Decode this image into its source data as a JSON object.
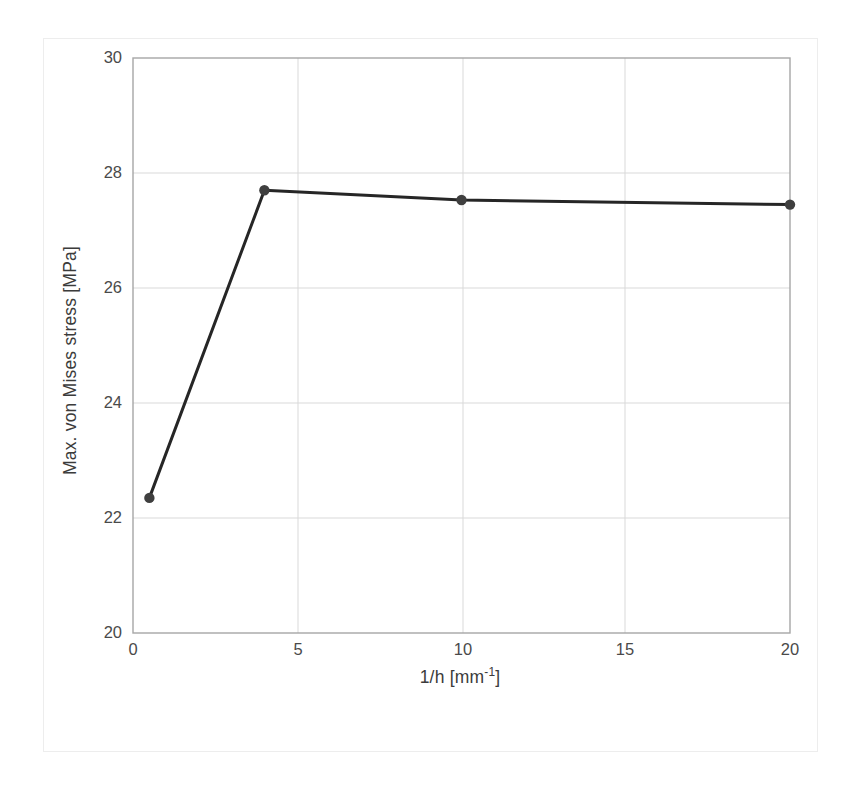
{
  "chart_data": {
    "type": "line",
    "title": "",
    "subtitle": "",
    "xlabel": "1/h [mm-1]",
    "xlabel_base": "1/h [mm",
    "xlabel_exponent": "-1",
    "xlabel_suffix": "]",
    "ylabel": "Max. von Mises stress [MPa]",
    "xlim": [
      0,
      20
    ],
    "ylim": [
      20,
      30
    ],
    "xticks": [
      0,
      5,
      10,
      15,
      20
    ],
    "xtick_labels": [
      "0",
      "5",
      "10",
      "15",
      "20"
    ],
    "yticks": [
      20,
      22,
      24,
      26,
      28,
      30
    ],
    "ytick_labels": [
      "20",
      "22",
      "24",
      "26",
      "28",
      "30"
    ],
    "grid": true,
    "grid_color": "#d9d9d9",
    "legend": false,
    "legend_position": "none",
    "series": [
      {
        "name": "Max. von Mises stress",
        "color": "#262626",
        "marker": "circle",
        "marker_color": "#3f3f3f",
        "line_width": 3.0,
        "x": [
          0.5,
          4,
          10,
          20
        ],
        "values": [
          22.35,
          27.7,
          27.53,
          27.45
        ],
        "points": [
          {
            "x": 0.5,
            "y": 22.35
          },
          {
            "x": 4,
            "y": 27.7
          },
          {
            "x": 10,
            "y": 27.53
          },
          {
            "x": 20,
            "y": 27.45
          }
        ]
      }
    ],
    "annotations": []
  },
  "figure": {
    "background": "#ffffff",
    "frame_color": "#ededed",
    "axis_color": "#a6a6a6"
  }
}
